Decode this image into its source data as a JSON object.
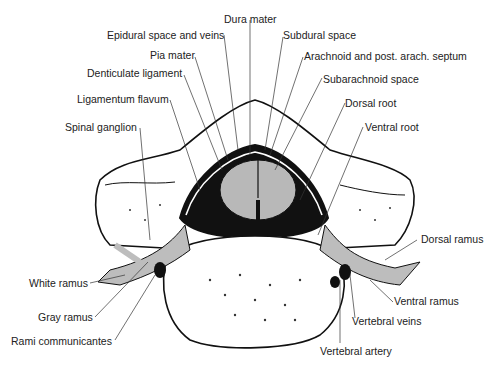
{
  "diagram": {
    "labels": {
      "dura_mater": "Dura mater",
      "epidural_space": "Epidural space and veins",
      "subdural_space": "Subdural space",
      "pia_mater": "Pia mater",
      "arachnoid": "Arachnoid and post. arach. septum",
      "denticulate_ligament": "Denticulate ligament",
      "subarachnoid_space": "Subarachnoid space",
      "ligamentum_flavum": "Ligamentum flavum",
      "dorsal_root": "Dorsal root",
      "spinal_ganglion": "Spinal ganglion",
      "ventral_root": "Ventral root",
      "dorsal_ramus": "Dorsal ramus",
      "white_ramus": "White ramus",
      "ventral_ramus": "Ventral ramus",
      "gray_ramus": "Gray ramus",
      "vertebral_veins": "Vertebral veins",
      "rami_communicantes": "Rami communicantes",
      "vertebral_artery": "Vertebral artery"
    },
    "colors": {
      "line": "#111111",
      "cord_gray": "#b8b8b8",
      "nerve_gray": "#bdbdbd",
      "dark_space": "#1a1a1a",
      "bone_fill": "#ffffff"
    }
  }
}
